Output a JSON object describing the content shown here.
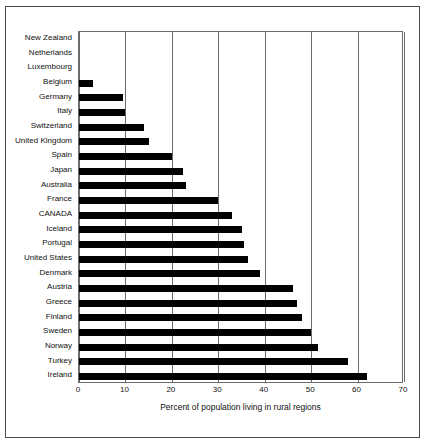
{
  "chart_data": {
    "type": "bar",
    "orientation": "horizontal",
    "title": "",
    "xlabel": "Percent of population living in rural regions",
    "ylabel": "",
    "xlim": [
      0,
      70
    ],
    "xticks": [
      0,
      10,
      20,
      30,
      40,
      50,
      60,
      70
    ],
    "xtick_labels": [
      "0",
      "10",
      "20",
      "30",
      "40",
      "50",
      "60",
      "70"
    ],
    "grid": true,
    "legend": false,
    "bar_color": "#000000",
    "frame_color": "#4a4a4a",
    "axis_color": "#6b6b6b",
    "categories": [
      "New Zealand",
      "Netherlands",
      "Luxembourg",
      "Belgium",
      "Germany",
      "Italy",
      "Switzerland",
      "United Kingdom",
      "Spain",
      "Japan",
      "Australia",
      "France",
      "CANADA",
      "Iceland",
      "Portugal",
      "United States",
      "Denmark",
      "Austria",
      "Greece",
      "Finland",
      "Sweden",
      "Norway",
      "Turkey",
      "Ireland"
    ],
    "values": [
      0,
      0,
      0,
      3,
      9.5,
      10,
      14,
      15,
      20,
      22.5,
      23,
      30,
      33,
      35,
      35.5,
      36.5,
      39,
      46,
      47,
      48,
      50,
      51.5,
      58,
      62
    ]
  }
}
